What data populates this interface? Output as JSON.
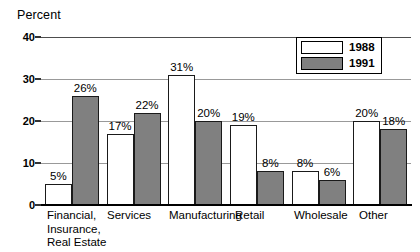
{
  "chart_data": {
    "type": "bar",
    "title": "",
    "ylabel": "Percent",
    "xlabel": "",
    "ylim": [
      0,
      40
    ],
    "yticks": [
      0,
      10,
      20,
      30,
      40
    ],
    "ytick_labels": [
      "0",
      "10",
      "20",
      "30",
      "40"
    ],
    "grid": true,
    "legend_position": "top-right",
    "value_suffix": "%",
    "categories": [
      "Financial,\nInsurance,\nReal Estate",
      "Services",
      "Manufacturing",
      "Retail",
      "Wholesale",
      "Other"
    ],
    "series": [
      {
        "name": "1988",
        "color": "#ffffff",
        "values": [
          5,
          17,
          31,
          19,
          8,
          20
        ],
        "labels": [
          "5%",
          "17%",
          "31%",
          "19%",
          "8%",
          "20%"
        ]
      },
      {
        "name": "1991",
        "color": "#808080",
        "values": [
          26,
          22,
          20,
          8,
          6,
          18
        ],
        "labels": [
          "26%",
          "22%",
          "20%",
          "8%",
          "6%",
          "18%"
        ]
      }
    ]
  },
  "legend": {
    "entries": [
      {
        "label": "1988",
        "swatch": "white"
      },
      {
        "label": "1991",
        "swatch": "gray"
      }
    ]
  },
  "colors": {
    "series_1988": "#ffffff",
    "series_1991": "#808080",
    "outline": "#1a1a1a",
    "gridline": "#999999",
    "axis": "#000000"
  }
}
